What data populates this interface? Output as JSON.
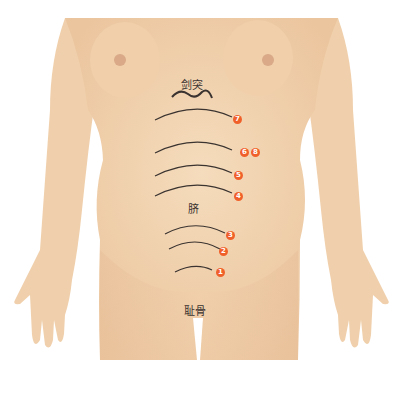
{
  "diagram": {
    "colors": {
      "skin": "#f2d4b0",
      "skin_shadow": "#e6bf98",
      "line": "#3a3330",
      "marker": "#f0602a",
      "background": "#ffffff"
    },
    "labels": {
      "xiphoid": "剑突",
      "navel": "脐",
      "pubis": "耻骨"
    },
    "markers": [
      {
        "id": "7",
        "label": "7"
      },
      {
        "id": "6",
        "label": "6"
      },
      {
        "id": "8",
        "label": "8"
      },
      {
        "id": "5",
        "label": "5"
      },
      {
        "id": "4",
        "label": "4"
      },
      {
        "id": "3",
        "label": "3"
      },
      {
        "id": "2",
        "label": "2"
      },
      {
        "id": "1",
        "label": "1"
      }
    ]
  }
}
